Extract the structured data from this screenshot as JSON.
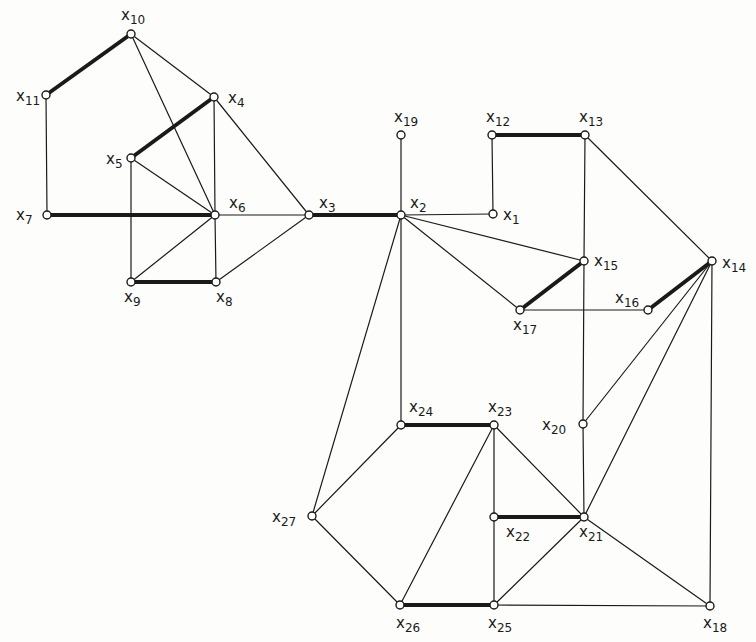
{
  "diagram": {
    "type": "graph",
    "colors": {
      "background": "#fdfdfc",
      "stroke": "#1a1a1a",
      "node_fill": "#ffffff"
    },
    "nodes": [
      {
        "id": "x1",
        "label_base": "x",
        "label_sub": "1",
        "x": 493,
        "y": 214,
        "lx": 503,
        "ly": 220
      },
      {
        "id": "x2",
        "label_base": "x",
        "label_sub": "2",
        "x": 401,
        "y": 215,
        "lx": 410,
        "ly": 208
      },
      {
        "id": "x3",
        "label_base": "x",
        "label_sub": "3",
        "x": 309,
        "y": 215,
        "lx": 319,
        "ly": 208
      },
      {
        "id": "x4",
        "label_base": "x",
        "label_sub": "4",
        "x": 214,
        "y": 97,
        "lx": 228,
        "ly": 103
      },
      {
        "id": "x5",
        "label_base": "x",
        "label_sub": "5",
        "x": 131,
        "y": 158,
        "lx": 106,
        "ly": 164
      },
      {
        "id": "x6",
        "label_base": "x",
        "label_sub": "6",
        "x": 215,
        "y": 215,
        "lx": 229,
        "ly": 208
      },
      {
        "id": "x7",
        "label_base": "x",
        "label_sub": "7",
        "x": 47,
        "y": 215,
        "lx": 16,
        "ly": 220
      },
      {
        "id": "x8",
        "label_base": "x",
        "label_sub": "8",
        "x": 216,
        "y": 282,
        "lx": 216,
        "ly": 302
      },
      {
        "id": "x9",
        "label_base": "x",
        "label_sub": "9",
        "x": 131,
        "y": 282,
        "lx": 124,
        "ly": 302
      },
      {
        "id": "x10",
        "label_base": "x",
        "label_sub": "10",
        "x": 131,
        "y": 34,
        "lx": 121,
        "ly": 20
      },
      {
        "id": "x11",
        "label_base": "x",
        "label_sub": "11",
        "x": 46,
        "y": 95,
        "lx": 16,
        "ly": 101
      },
      {
        "id": "x12",
        "label_base": "x",
        "label_sub": "12",
        "x": 492,
        "y": 135,
        "lx": 486,
        "ly": 122
      },
      {
        "id": "x13",
        "label_base": "x",
        "label_sub": "13",
        "x": 585,
        "y": 135,
        "lx": 579,
        "ly": 122
      },
      {
        "id": "x14",
        "label_base": "x",
        "label_sub": "14",
        "x": 712,
        "y": 261,
        "lx": 722,
        "ly": 268
      },
      {
        "id": "x15",
        "label_base": "x",
        "label_sub": "15",
        "x": 584,
        "y": 261,
        "lx": 594,
        "ly": 266
      },
      {
        "id": "x16",
        "label_base": "x",
        "label_sub": "16",
        "x": 648,
        "y": 310,
        "lx": 615,
        "ly": 303
      },
      {
        "id": "x17",
        "label_base": "x",
        "label_sub": "17",
        "x": 520,
        "y": 310,
        "lx": 513,
        "ly": 330
      },
      {
        "id": "x18",
        "label_base": "x",
        "label_sub": "18",
        "x": 710,
        "y": 606,
        "lx": 703,
        "ly": 628
      },
      {
        "id": "x19",
        "label_base": "x",
        "label_sub": "19",
        "x": 401,
        "y": 135,
        "lx": 394,
        "ly": 122
      },
      {
        "id": "x20",
        "label_base": "x",
        "label_sub": "20",
        "x": 583,
        "y": 424,
        "lx": 542,
        "ly": 430
      },
      {
        "id": "x21",
        "label_base": "x",
        "label_sub": "21",
        "x": 584,
        "y": 517,
        "lx": 579,
        "ly": 537
      },
      {
        "id": "x22",
        "label_base": "x",
        "label_sub": "22",
        "x": 494,
        "y": 517,
        "lx": 506,
        "ly": 537
      },
      {
        "id": "x23",
        "label_base": "x",
        "label_sub": "23",
        "x": 494,
        "y": 425,
        "lx": 488,
        "ly": 412
      },
      {
        "id": "x24",
        "label_base": "x",
        "label_sub": "24",
        "x": 401,
        "y": 425,
        "lx": 409,
        "ly": 412
      },
      {
        "id": "x25",
        "label_base": "x",
        "label_sub": "25",
        "x": 494,
        "y": 605,
        "lx": 488,
        "ly": 628
      },
      {
        "id": "x26",
        "label_base": "x",
        "label_sub": "26",
        "x": 400,
        "y": 605,
        "lx": 396,
        "ly": 628
      },
      {
        "id": "x27",
        "label_base": "x",
        "label_sub": "27",
        "x": 312,
        "y": 516,
        "lx": 272,
        "ly": 522
      }
    ],
    "edges": [
      {
        "from": "x10",
        "to": "x11",
        "bold": true
      },
      {
        "from": "x10",
        "to": "x4",
        "bold": false
      },
      {
        "from": "x10",
        "to": "x6",
        "bold": false
      },
      {
        "from": "x11",
        "to": "x7",
        "bold": false
      },
      {
        "from": "x4",
        "to": "x5",
        "bold": true
      },
      {
        "from": "x4",
        "to": "x6",
        "bold": false
      },
      {
        "from": "x4",
        "to": "x3",
        "bold": false
      },
      {
        "from": "x5",
        "to": "x6",
        "bold": false
      },
      {
        "from": "x5",
        "to": "x9",
        "bold": false
      },
      {
        "from": "x7",
        "to": "x6",
        "bold": true
      },
      {
        "from": "x6",
        "to": "x3",
        "bold": false
      },
      {
        "from": "x6",
        "to": "x9",
        "bold": false
      },
      {
        "from": "x6",
        "to": "x8",
        "bold": false
      },
      {
        "from": "x9",
        "to": "x8",
        "bold": true
      },
      {
        "from": "x8",
        "to": "x3",
        "bold": false
      },
      {
        "from": "x3",
        "to": "x2",
        "bold": true
      },
      {
        "from": "x2",
        "to": "x19",
        "bold": false
      },
      {
        "from": "x2",
        "to": "x1",
        "bold": false
      },
      {
        "from": "x2",
        "to": "x15",
        "bold": false
      },
      {
        "from": "x2",
        "to": "x17",
        "bold": false
      },
      {
        "from": "x2",
        "to": "x24",
        "bold": false
      },
      {
        "from": "x2",
        "to": "x27",
        "bold": false
      },
      {
        "from": "x1",
        "to": "x12",
        "bold": false
      },
      {
        "from": "x12",
        "to": "x13",
        "bold": true
      },
      {
        "from": "x13",
        "to": "x15",
        "bold": false
      },
      {
        "from": "x13",
        "to": "x14",
        "bold": false
      },
      {
        "from": "x15",
        "to": "x17",
        "bold": true
      },
      {
        "from": "x15",
        "to": "x20",
        "bold": false
      },
      {
        "from": "x17",
        "to": "x16",
        "bold": false
      },
      {
        "from": "x16",
        "to": "x14",
        "bold": true
      },
      {
        "from": "x14",
        "to": "x20",
        "bold": false
      },
      {
        "from": "x14",
        "to": "x21",
        "bold": false
      },
      {
        "from": "x14",
        "to": "x18",
        "bold": false
      },
      {
        "from": "x20",
        "to": "x21",
        "bold": false
      },
      {
        "from": "x24",
        "to": "x23",
        "bold": true
      },
      {
        "from": "x24",
        "to": "x27",
        "bold": false
      },
      {
        "from": "x27",
        "to": "x26",
        "bold": false
      },
      {
        "from": "x23",
        "to": "x26",
        "bold": false
      },
      {
        "from": "x23",
        "to": "x22",
        "bold": false
      },
      {
        "from": "x23",
        "to": "x21",
        "bold": false
      },
      {
        "from": "x22",
        "to": "x21",
        "bold": true
      },
      {
        "from": "x22",
        "to": "x25",
        "bold": false
      },
      {
        "from": "x26",
        "to": "x25",
        "bold": true
      },
      {
        "from": "x25",
        "to": "x21",
        "bold": false
      },
      {
        "from": "x25",
        "to": "x18",
        "bold": false
      },
      {
        "from": "x21",
        "to": "x18",
        "bold": false
      }
    ]
  }
}
